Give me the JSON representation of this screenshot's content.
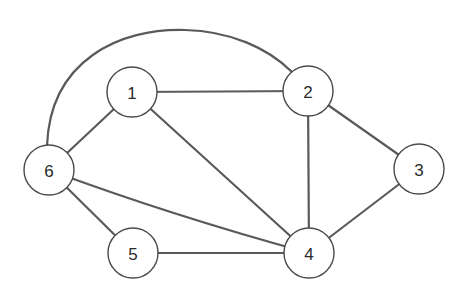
{
  "graph": {
    "type": "undirected",
    "nodes": [
      {
        "id": "1",
        "label": "1",
        "x": 132,
        "y": 92
      },
      {
        "id": "2",
        "label": "2",
        "x": 308,
        "y": 91
      },
      {
        "id": "3",
        "label": "3",
        "x": 419,
        "y": 169
      },
      {
        "id": "4",
        "label": "4",
        "x": 309,
        "y": 253
      },
      {
        "id": "5",
        "label": "5",
        "x": 133,
        "y": 253
      },
      {
        "id": "6",
        "label": "6",
        "x": 49,
        "y": 170
      }
    ],
    "edges": [
      {
        "from": "1",
        "to": "2"
      },
      {
        "from": "1",
        "to": "6"
      },
      {
        "from": "1",
        "to": "4"
      },
      {
        "from": "2",
        "to": "4"
      },
      {
        "from": "2",
        "to": "3"
      },
      {
        "from": "2",
        "to": "6",
        "curved": true
      },
      {
        "from": "3",
        "to": "4"
      },
      {
        "from": "6",
        "to": "4"
      },
      {
        "from": "6",
        "to": "5"
      },
      {
        "from": "5",
        "to": "4"
      }
    ],
    "node_radius": 25,
    "colors": {
      "edge": "#5a5a5a",
      "node_stroke": "#4a4a4a",
      "node_fill": "#ffffff",
      "label": "#2a2a2a"
    }
  }
}
